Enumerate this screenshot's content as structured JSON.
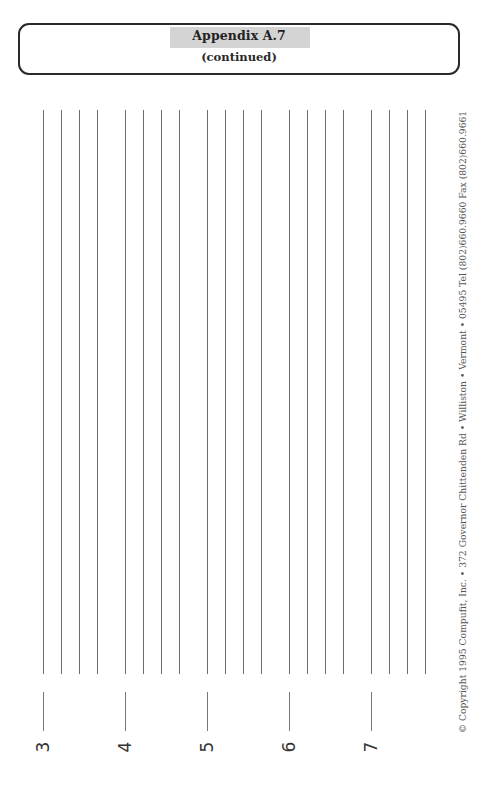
{
  "header": {
    "title": "Appendix A.7",
    "subtitle": "(continued)",
    "title_highlight_color": "#d4d4d4"
  },
  "rows": [
    {
      "label": "3",
      "line_x": [
        43,
        61,
        79,
        97
      ],
      "tick_x": 43,
      "label_x": 33
    },
    {
      "label": "4",
      "line_x": [
        125,
        143,
        161,
        179
      ],
      "tick_x": 125,
      "label_x": 115
    },
    {
      "label": "5",
      "line_x": [
        207,
        225,
        243,
        261
      ],
      "tick_x": 207,
      "label_x": 197
    },
    {
      "label": "6",
      "line_x": [
        289,
        307,
        325,
        343
      ],
      "tick_x": 289,
      "label_x": 279
    },
    {
      "label": "7",
      "line_x": [
        371,
        389,
        407,
        425
      ],
      "tick_x": 371,
      "label_x": 361
    }
  ],
  "footer": {
    "copyright": "© Copyright 1995 Compufit, Inc.  •  372 Governor Chittenden Rd  •  Williston  •  Vermont  •  05495    Tel (802)660.9660    Fax (802)660.9661"
  }
}
